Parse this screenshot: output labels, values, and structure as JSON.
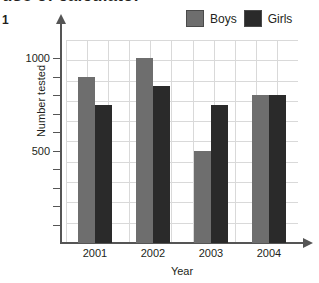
{
  "heading": {
    "text": "use of calculator"
  },
  "question_number": "1",
  "legend": {
    "position": "top-right",
    "entries": [
      {
        "label": "Boys",
        "color": "#6e6e6e",
        "icon": "legend-swatch"
      },
      {
        "label": "Girls",
        "color": "#2a2a2a",
        "icon": "legend-swatch"
      }
    ]
  },
  "axes": {
    "y_title": "Number tested",
    "x_title": "Year",
    "y_labels": [
      "1000",
      "500"
    ],
    "x_labels": [
      "2001",
      "2002",
      "2003",
      "2004"
    ]
  },
  "chart_data": {
    "type": "bar",
    "title": "use of calculator",
    "xlabel": "Year",
    "ylabel": "Number tested",
    "categories": [
      "2001",
      "2002",
      "2003",
      "2004"
    ],
    "series": [
      {
        "name": "Boys",
        "color": "#6e6e6e",
        "values": [
          900,
          1000,
          500,
          800
        ]
      },
      {
        "name": "Girls",
        "color": "#2a2a2a",
        "values": [
          750,
          850,
          750,
          800
        ]
      }
    ],
    "ylim": [
      0,
      1100
    ],
    "ytick_labeled": [
      500,
      1000
    ],
    "ytick_interval": 100,
    "grid": true,
    "legend_position": "top-right"
  }
}
